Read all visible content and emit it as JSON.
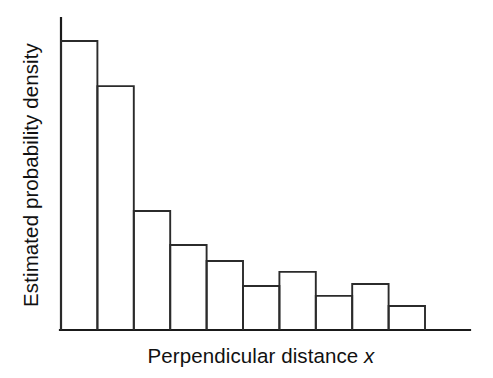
{
  "figure": {
    "width": 493,
    "height": 378,
    "background_color": "#ffffff",
    "line_color": "#2b2b2b",
    "axis_color": "#1a1a1a",
    "text_color": "#111111"
  },
  "labels": {
    "x_axis_label_main": "Perpendicular distance",
    "x_axis_label_variable": "x",
    "y_axis_label": "Estimated probability density"
  },
  "chart_data": {
    "type": "bar",
    "title": "",
    "subtitle": "",
    "xlabel": "Perpendicular distance x",
    "ylabel": "Estimated probability density",
    "orientation": "vertical",
    "grid": false,
    "legend": false,
    "legend_position": "none",
    "x_tick_labels": [],
    "y_tick_labels": [],
    "xlim": [
      0,
      10
    ],
    "ylim": [
      0,
      1
    ],
    "bin_edges": [
      0,
      1,
      2,
      3,
      4,
      5,
      6,
      7,
      8,
      9,
      10
    ],
    "categories": [
      "bin-1",
      "bin-2",
      "bin-3",
      "bin-4",
      "bin-5",
      "bin-6",
      "bin-7",
      "bin-8",
      "bin-9",
      "bin-10"
    ],
    "values": [
      1.0,
      0.844,
      0.412,
      0.294,
      0.239,
      0.152,
      0.201,
      0.118,
      0.159,
      0.083
    ],
    "bar_style": "outline",
    "bar_fill": "none",
    "bar_edge_color": "#2b2b2b"
  },
  "geometry": {
    "plot_left": 61,
    "plot_right": 425,
    "axis_right_end": 470,
    "baseline_y": 330,
    "y_axis_top": 18,
    "max_bar_height_px": 289,
    "bar_width_px": 36.4
  }
}
